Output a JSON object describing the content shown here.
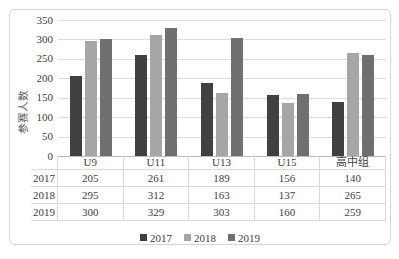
{
  "colors": {
    "frame_border": "#d6d6d6",
    "gridline": "#dcdcdc",
    "axis_line": "#bdbdbd",
    "table_border": "#d9d9d9",
    "text": "#404040"
  },
  "chart_data": {
    "type": "bar",
    "categories": [
      "U9",
      "U11",
      "U13",
      "U15",
      "高中组"
    ],
    "series": [
      {
        "name": "2017",
        "color": "#404040",
        "values": [
          205,
          261,
          189,
          156,
          140
        ]
      },
      {
        "name": "2018",
        "color": "#a6a6a6",
        "values": [
          295,
          312,
          163,
          137,
          265
        ]
      },
      {
        "name": "2019",
        "color": "#707070",
        "values": [
          300,
          329,
          303,
          160,
          259
        ]
      }
    ],
    "ylabel": "参赛人数",
    "ylim": [
      0,
      350
    ],
    "ytick_step": 50,
    "yticks": [
      350,
      300,
      250,
      200,
      150,
      100,
      50,
      0
    ],
    "grid": true,
    "legend_position": "bottom",
    "data_table_shown": true
  }
}
